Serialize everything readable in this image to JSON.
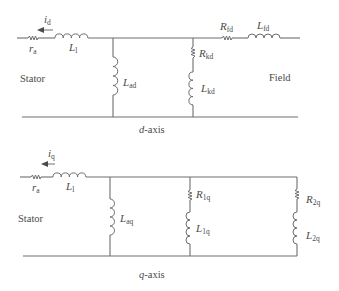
{
  "figure": {
    "d_axis": {
      "title_var": "d",
      "title_suffix": "-axis",
      "current": {
        "sym": "i",
        "sub": "d",
        "direction": "left"
      },
      "labels": {
        "stator": "Stator",
        "field": "Field",
        "ra": {
          "sym": "r",
          "sub": "a"
        },
        "L1": {
          "sym": "L",
          "sub": "l"
        },
        "Lad": {
          "sym": "L",
          "sub": "ad"
        },
        "Rkd": {
          "sym": "R",
          "sub": "kd"
        },
        "Lkd": {
          "sym": "L",
          "sub": "kd"
        },
        "Rfd": {
          "sym": "R",
          "sub": "fd"
        },
        "Lfd": {
          "sym": "L",
          "sub": "fd"
        }
      }
    },
    "q_axis": {
      "title_var": "q",
      "title_suffix": "-axis",
      "current": {
        "sym": "i",
        "sub": "q",
        "direction": "left"
      },
      "labels": {
        "stator": "Stator",
        "ra": {
          "sym": "r",
          "sub": "a"
        },
        "L1": {
          "sym": "L",
          "sub": "l"
        },
        "Laq": {
          "sym": "L",
          "sub": "aq"
        },
        "R1q": {
          "sym": "R",
          "sub": "1q"
        },
        "L1q": {
          "sym": "L",
          "sub": "1q"
        },
        "R2q": {
          "sym": "R",
          "sub": "2q"
        },
        "L2q": {
          "sym": "L",
          "sub": "2q"
        }
      }
    },
    "colors": {
      "line": "#6e6e6e",
      "text": "#4a4a4a",
      "background": "#ffffff"
    }
  }
}
